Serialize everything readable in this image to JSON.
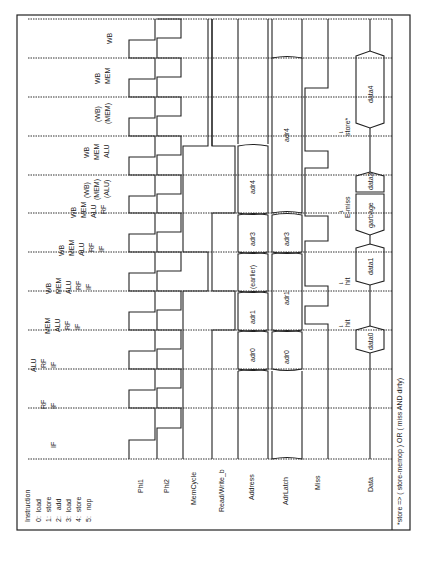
{
  "diagram": {
    "orientation": "rotated 90 degrees counter-clockwise",
    "row_header": {
      "title": "Instruction",
      "instructions": [
        {
          "index": "0:",
          "op": "load"
        },
        {
          "index": "1:",
          "op": "store"
        },
        {
          "index": "2:",
          "op": "add"
        },
        {
          "index": "3:",
          "op": "load"
        },
        {
          "index": "4:",
          "op": "store"
        },
        {
          "index": "5:",
          "op": "nop"
        }
      ]
    },
    "signals": [
      "Phi1",
      "Phi2",
      "MemCycle",
      "Read/Write_b",
      "Address",
      "AdrLatch",
      "Miss",
      "Data"
    ],
    "cycles": [
      {
        "stages": [
          "IF"
        ]
      },
      {
        "stages": [
          "RF",
          "IF"
        ]
      },
      {
        "stages": [
          "ALU",
          "RF",
          "IF"
        ]
      },
      {
        "stages": [
          "MEM",
          "ALU",
          "RF",
          "IF"
        ]
      },
      {
        "stages": [
          "WB",
          "MEM",
          "ALU",
          "RF",
          "IF"
        ]
      },
      {
        "stages": [
          "WB",
          "MEM",
          "ALU",
          "RF",
          "IF"
        ]
      },
      {
        "stages": [
          "WB",
          "MEM",
          "ALU",
          "RF"
        ]
      },
      {
        "stages": [
          "(WB)",
          "(MEM)",
          "(ALU)"
        ]
      },
      {
        "stages": [
          "WB",
          "MEM",
          "ALU"
        ]
      },
      {
        "stages": [
          "(WB)",
          "(MEM)"
        ]
      },
      {
        "stages": [
          "WB",
          "MEM"
        ]
      },
      {
        "stages": [
          "WB"
        ]
      }
    ],
    "address_values": [
      "adr0",
      "adr1",
      "(earlier)",
      "adr3",
      "adr4"
    ],
    "adrlatch_values": [
      "adr0",
      "adr1",
      "adr3",
      "adr4"
    ],
    "data_values": [
      "data0",
      "data1",
      "garbage",
      "data3",
      "data4"
    ],
    "annotations": [
      {
        "text": "hit",
        "arrow": "↓"
      },
      {
        "text": "hit",
        "arrow": "↓"
      },
      {
        "text": "E-miss",
        "arrow": "↓"
      },
      {
        "text": "store*",
        "arrow": "↓"
      }
    ],
    "footnote": "*store => ( store-memop ) OR ( miss AND dirty)"
  }
}
